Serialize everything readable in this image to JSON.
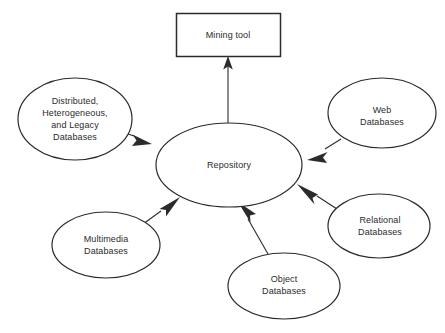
{
  "diagram": {
    "type": "data-mining-architecture",
    "background_color": "#ffffff",
    "stroke_color": "#2b2b2b",
    "text_color": "#2b2b2b",
    "nodes": [
      {
        "id": "mining-tool",
        "shape": "rectangle",
        "label": "Mining tool",
        "x": 176,
        "y": 13,
        "width": 104,
        "height": 44
      },
      {
        "id": "repository",
        "shape": "ellipse",
        "label": "Repository",
        "cx": 229,
        "cy": 165,
        "rx": 73,
        "ry": 42
      },
      {
        "id": "distributed-heterogeneous-legacy-databases",
        "shape": "ellipse",
        "label": "Distributed,\nHeterogeneous,\nand Legacy\nDatabases",
        "cx": 75,
        "cy": 119,
        "rx": 57,
        "ry": 41
      },
      {
        "id": "web-databases",
        "shape": "ellipse",
        "label": "Web\nDatabases",
        "cx": 382,
        "cy": 113,
        "rx": 54,
        "ry": 35
      },
      {
        "id": "relational-databases",
        "shape": "ellipse",
        "label": "Relational\nDatabases",
        "cx": 379,
        "cy": 226,
        "rx": 51,
        "ry": 32
      },
      {
        "id": "multimedia-databases",
        "shape": "ellipse",
        "label": "Multimedia\nDatabases",
        "cx": 106,
        "cy": 245,
        "rx": 54,
        "ry": 33
      },
      {
        "id": "object-databases",
        "shape": "ellipse",
        "label": "Object\nDatabases",
        "cx": 284,
        "cy": 286,
        "rx": 56,
        "ry": 33
      }
    ],
    "edges": [
      {
        "id": "repository-to-mining-tool",
        "from": "repository",
        "to": "mining-tool",
        "arrow": "filled"
      },
      {
        "id": "distributed-to-repository",
        "from": "distributed-heterogeneous-legacy-databases",
        "to": "repository",
        "arrow": "filled"
      },
      {
        "id": "web-to-repository",
        "from": "web-databases",
        "to": "repository",
        "arrow": "filled"
      },
      {
        "id": "relational-to-repository",
        "from": "relational-databases",
        "to": "repository",
        "arrow": "filled"
      },
      {
        "id": "multimedia-to-repository",
        "from": "multimedia-databases",
        "to": "repository",
        "arrow": "filled"
      },
      {
        "id": "object-to-repository",
        "from": "object-databases",
        "to": "repository",
        "arrow": "filled"
      }
    ]
  }
}
